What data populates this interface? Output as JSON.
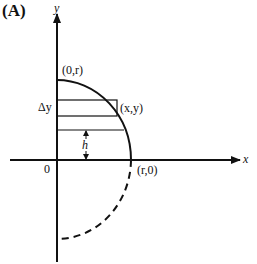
{
  "panel_label": "(A)",
  "axes": {
    "x_label": "x",
    "y_label": "y",
    "origin_label": "0"
  },
  "points": {
    "top": "(0,r)",
    "right": "(r,0)",
    "strip_corner": "(x,y)"
  },
  "annotations": {
    "delta_y": "Δy",
    "height": "h"
  },
  "colors": {
    "stroke": "#111111",
    "background": "#ffffff"
  }
}
